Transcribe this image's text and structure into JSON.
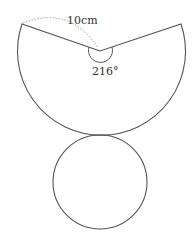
{
  "diagram": {
    "sector": {
      "radius_label": "10cm",
      "angle_label": "216°"
    },
    "base_circle": {},
    "colors": {
      "stroke": "#555555",
      "dotted": "#888888"
    }
  }
}
